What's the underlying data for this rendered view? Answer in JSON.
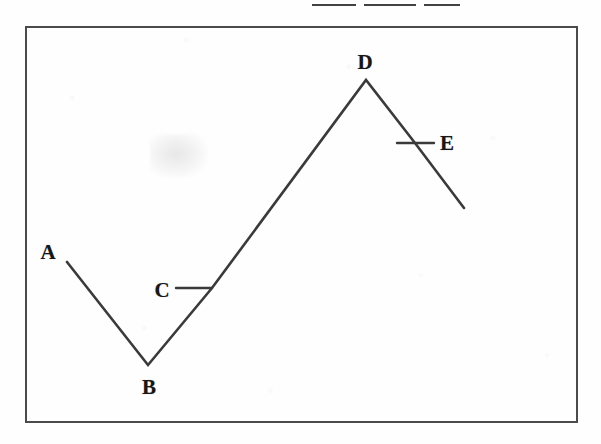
{
  "document": {
    "header_remnant_text": "",
    "frame": {
      "x": 25,
      "y": 26,
      "width": 553,
      "height": 397
    }
  },
  "figure": {
    "title": "",
    "line_color": "#3a3a3a",
    "label_color": "#171717",
    "frame_color": "#4b4b4b",
    "background_color": "#fefefe",
    "labels": [
      {
        "id": "A",
        "text": "A",
        "x": 48,
        "y": 252
      },
      {
        "id": "B",
        "text": "B",
        "x": 149,
        "y": 387
      },
      {
        "id": "C",
        "text": "C",
        "x": 162,
        "y": 290
      },
      {
        "id": "D",
        "text": "D",
        "x": 365,
        "y": 62
      },
      {
        "id": "E",
        "text": "E",
        "x": 447,
        "y": 143
      }
    ],
    "leader_lines": [
      {
        "for": "C",
        "x1": 176,
        "y1": 288,
        "x2": 212,
        "y2": 288
      },
      {
        "for": "E",
        "x1": 397,
        "y1": 143,
        "x2": 434,
        "y2": 143
      }
    ]
  },
  "chart_data": {
    "type": "line",
    "title": "",
    "xlabel": "",
    "ylabel": "",
    "grid": false,
    "legend": false,
    "point_labels": [
      "A",
      "B",
      "C",
      "D",
      "E"
    ],
    "annotation_note": "Zigzag polyline: descends A to B, rises through C to peak D, then descends through E.",
    "points_pixels": [
      {
        "label": "A",
        "x": 67,
        "y": 262
      },
      {
        "label": "B",
        "x": 148,
        "y": 365
      },
      {
        "label": "D",
        "x": 366,
        "y": 80
      },
      {
        "label": "end",
        "x": 464,
        "y": 208
      }
    ],
    "marked_on_segments": [
      {
        "label": "C",
        "segment": "B-D",
        "x": 212,
        "y": 288
      },
      {
        "label": "E",
        "segment": "D-end",
        "x": 415,
        "y": 143
      }
    ],
    "x": [
      67,
      148,
      212,
      366,
      415,
      464
    ],
    "y": [
      262,
      365,
      288,
      80,
      143,
      208
    ],
    "xlim": [
      25,
      578
    ],
    "ylim": [
      423,
      26
    ]
  }
}
